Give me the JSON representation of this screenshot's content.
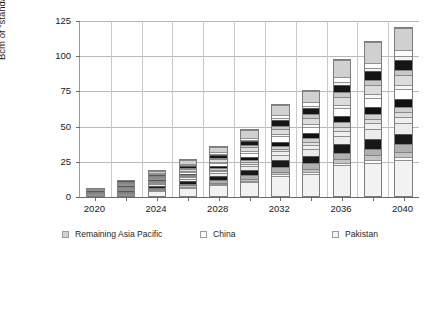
{
  "chart_data": {
    "type": "bar",
    "stacked": true,
    "title": "",
    "xlabel": "",
    "ylabel": "Bcm of \"standard gas\" equivalent",
    "ylim": [
      0,
      125
    ],
    "yticks": [
      0,
      25,
      50,
      75,
      100,
      125
    ],
    "grid": true,
    "legend_position": "bottom",
    "x": [
      2020,
      2022,
      2024,
      2026,
      2028,
      2030,
      2032,
      2034,
      2036,
      2038,
      2040
    ],
    "xtick_labels": [
      "2020",
      "2024",
      "2028",
      "2032",
      "2036",
      "2040"
    ],
    "xtick_values": [
      2020,
      2024,
      2028,
      2032,
      2036,
      2040
    ],
    "totals": [
      6.5,
      12.0,
      19.5,
      27.0,
      36.5,
      48.5,
      66.0,
      78.0,
      98.0,
      111.0,
      121.0
    ],
    "series": [
      {
        "name": "Russia",
        "color": "#f2f2f2",
        "values": [
          2.6,
          4.0,
          5.2,
          6.5,
          8.0,
          10.2,
          14.5,
          16.0,
          22.0,
          24.0,
          26.0
        ]
      },
      {
        "name": "Qatar",
        "color": "#d5d5d5",
        "values": [
          0.0,
          0.0,
          0.0,
          0.0,
          0.0,
          0.0,
          0.0,
          0.0,
          0.0,
          0.0,
          0.0
        ]
      },
      {
        "name": "Uzbekistan",
        "color": "#fafafa",
        "values": [
          0.2,
          0.3,
          0.5,
          0.6,
          0.8,
          1.0,
          1.3,
          1.5,
          1.8,
          2.0,
          2.2
        ]
      },
      {
        "name": "Kazakhstan",
        "color": "#c4c4c4",
        "values": [
          0.3,
          0.5,
          0.7,
          0.9,
          1.2,
          1.5,
          2.0,
          2.4,
          2.8,
          3.2,
          3.5
        ]
      },
      {
        "name": "Turkmenistan",
        "color": "#b0b0b0",
        "values": [
          0.4,
          0.7,
          1.0,
          1.4,
          1.8,
          2.4,
          3.2,
          3.8,
          4.5,
          5.0,
          5.5
        ]
      },
      {
        "name": "Remaining FSU",
        "color": "#181818",
        "values": [
          0.7,
          1.2,
          1.8,
          2.3,
          3.0,
          3.8,
          4.8,
          5.4,
          6.2,
          6.8,
          7.2
        ]
      },
      {
        "name": "Iran",
        "color": "#ececec",
        "values": [
          0.3,
          0.6,
          1.0,
          1.4,
          2.0,
          2.8,
          4.0,
          4.8,
          6.0,
          7.0,
          7.8
        ]
      },
      {
        "name": "Remaining Middle East",
        "color": "#efefef",
        "values": [
          0.2,
          0.4,
          0.7,
          1.0,
          1.4,
          1.9,
          2.6,
          3.1,
          3.9,
          4.4,
          4.8
        ]
      },
      {
        "name": "Egypt",
        "color": "#e0e0e0",
        "values": [
          0.2,
          0.3,
          0.5,
          0.7,
          1.0,
          1.3,
          1.8,
          2.2,
          2.7,
          3.0,
          3.3
        ]
      },
      {
        "name": "Algeria",
        "color": "#cfcfcf",
        "values": [
          0.2,
          0.4,
          0.6,
          0.9,
          1.2,
          1.6,
          2.2,
          2.6,
          3.2,
          3.6,
          3.9
        ]
      },
      {
        "name": "Remaining Africa",
        "color": "#111111",
        "values": [
          0.3,
          0.6,
          0.9,
          1.3,
          1.8,
          2.4,
          3.2,
          3.8,
          4.7,
          5.3,
          5.8
        ]
      },
      {
        "name": "Europe",
        "color": "#ffffff",
        "values": [
          0.3,
          0.6,
          1.0,
          1.5,
          2.1,
          2.9,
          3.9,
          4.6,
          5.7,
          6.4,
          7.0
        ]
      },
      {
        "name": "Venezuela",
        "color": "#f7f7f7",
        "values": [
          0.1,
          0.2,
          0.4,
          0.6,
          0.9,
          1.2,
          1.6,
          1.9,
          2.4,
          2.7,
          3.0
        ]
      },
      {
        "name": "United States",
        "color": "#dcdcdc",
        "values": [
          0.2,
          0.5,
          0.9,
          1.4,
          2.0,
          2.8,
          3.9,
          4.6,
          5.8,
          6.5,
          7.1
        ]
      },
      {
        "name": "Remaining Americas",
        "color": "#c8c8c8",
        "values": [
          0.1,
          0.3,
          0.5,
          0.8,
          1.1,
          1.5,
          2.1,
          2.5,
          3.1,
          3.5,
          3.8
        ]
      },
      {
        "name": "Australia",
        "color": "#151515",
        "values": [
          0.2,
          0.5,
          0.9,
          1.4,
          2.0,
          2.8,
          3.8,
          4.5,
          5.6,
          6.3,
          6.9
        ]
      },
      {
        "name": "Pakistan",
        "color": "#f5f5f5",
        "values": [
          0.1,
          0.2,
          0.4,
          0.6,
          0.8,
          1.1,
          1.5,
          1.8,
          2.2,
          2.5,
          2.7
        ]
      },
      {
        "name": "China",
        "color": "#fbfbfb",
        "values": [
          0.1,
          0.3,
          0.5,
          0.8,
          1.2,
          1.6,
          2.3,
          2.7,
          3.4,
          3.8,
          4.2
        ]
      },
      {
        "name": "Remaining Asia Pacific",
        "color": "#d0d0d0",
        "values": [
          0.2,
          0.4,
          2.0,
          2.9,
          4.2,
          5.7,
          7.3,
          7.8,
          12.0,
          15.0,
          16.3
        ]
      }
    ]
  },
  "axes": {
    "y_title": "Bcm of \"standard gas\" equivalent",
    "y_ticks": [
      "0",
      "25",
      "50",
      "75",
      "100",
      "125"
    ],
    "x_ticks": [
      "2020",
      "2024",
      "2028",
      "2032",
      "2036",
      "2040"
    ]
  },
  "legend": {
    "columns": [
      [
        {
          "label": "Remaining Asia Pacific",
          "color": "#d0d0d0"
        },
        {
          "label": "China",
          "color": "#fbfbfb"
        },
        {
          "label": "Pakistan",
          "color": "#f5f5f5"
        },
        {
          "label": "Australia",
          "color": "#151515"
        },
        {
          "label": "Remaining Americas",
          "color": "#c8c8c8"
        },
        {
          "label": "United States",
          "color": "#dcdcdc"
        }
      ],
      [
        {
          "label": "Venezuela",
          "color": "#f7f7f7"
        },
        {
          "label": "Europe",
          "color": "#ffffff"
        },
        {
          "label": "Remaining Africa",
          "color": "#111111"
        },
        {
          "label": "Algeria",
          "color": "#cfcfcf"
        },
        {
          "label": "Egypt",
          "color": "#e0e0e0"
        },
        {
          "label": "Remaining Middle East",
          "color": "#efefef"
        }
      ],
      [
        {
          "label": "Iran",
          "color": "#ececec"
        },
        {
          "label": "Remaining FSU",
          "color": "#181818"
        },
        {
          "label": "Turkmenistan",
          "color": "#b0b0b0"
        },
        {
          "label": "Kazakhstan",
          "color": "#c4c4c4"
        },
        {
          "label": "Uzbekistan",
          "color": "#fafafa"
        },
        {
          "label": "Russia",
          "color": "#f2f2f2"
        }
      ]
    ]
  }
}
